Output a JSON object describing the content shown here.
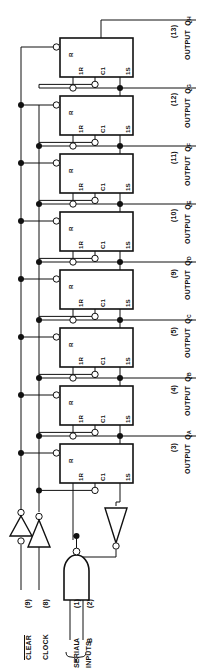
{
  "diagram": {
    "orientation": "rotated-90",
    "line_color": "#111111",
    "fill_color": "#ffffff"
  },
  "flipflops": [
    {
      "id": "ffA",
      "label_r": "R",
      "label_1r": "1R",
      "label_c1": "C1",
      "label_1s": "1S"
    },
    {
      "id": "ffB",
      "label_r": "R",
      "label_1r": "1R",
      "label_c1": "C1",
      "label_1s": "1S"
    },
    {
      "id": "ffC",
      "label_r": "R",
      "label_1r": "1R",
      "label_c1": "C1",
      "label_1s": "1S"
    },
    {
      "id": "ffD",
      "label_r": "R",
      "label_1r": "1R",
      "label_c1": "C1",
      "label_1s": "1S"
    },
    {
      "id": "ffE",
      "label_r": "R",
      "label_1r": "1R",
      "label_c1": "C1",
      "label_1s": "1S"
    },
    {
      "id": "ffF",
      "label_r": "R",
      "label_1r": "1R",
      "label_c1": "C1",
      "label_1s": "1S"
    },
    {
      "id": "ffG",
      "label_r": "R",
      "label_1r": "1R",
      "label_c1": "C1",
      "label_1s": "1S"
    },
    {
      "id": "ffH",
      "label_r": "R",
      "label_1r": "1R",
      "label_c1": "C1",
      "label_1s": "1S"
    }
  ],
  "outputs": [
    {
      "pin": "(13)",
      "word": "OUTPUT",
      "name": "Q",
      "sub": "H"
    },
    {
      "pin": "(12)",
      "word": "OUTPUT",
      "name": "Q",
      "sub": "G"
    },
    {
      "pin": "(11)",
      "word": "OUTPUT",
      "name": "Q",
      "sub": "F"
    },
    {
      "pin": "(10)",
      "word": "OUTPUT",
      "name": "Q",
      "sub": "E"
    },
    {
      "pin": "(9)",
      "word": "OUTPUT",
      "name": "Q",
      "sub": "D"
    },
    {
      "pin": "(5)",
      "word": "OUTPUT",
      "name": "Q",
      "sub": "C"
    },
    {
      "pin": "(4)",
      "word": "OUTPUT",
      "name": "Q",
      "sub": "B"
    },
    {
      "pin": "(3)",
      "word": "OUTPUT",
      "name": "Q",
      "sub": "A"
    }
  ],
  "inputs": {
    "clear": {
      "label": "CLEAR",
      "pin": "(9)",
      "active_low": true
    },
    "clock": {
      "label": "CLOCK",
      "pin": "(8)",
      "active_low": false
    },
    "serial": {
      "group_label_line1": "SERIAL",
      "group_label_line2": "INPUTS",
      "a": {
        "name": "A",
        "pin": "(1)"
      },
      "b": {
        "name": "B",
        "pin": "(2)"
      }
    }
  },
  "gates": {
    "clear_inverter": "inverter",
    "clock_inverter": "inverter",
    "feedback_inverter": "inverter",
    "serial_nand": "nand-gate-2-input"
  }
}
